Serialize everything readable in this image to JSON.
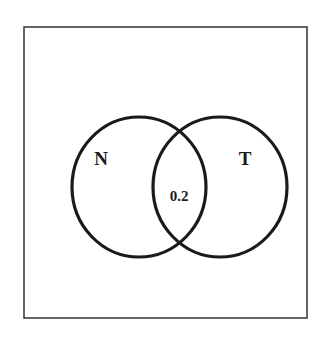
{
  "diagram": {
    "type": "venn",
    "sets": [
      {
        "label": "N"
      },
      {
        "label": "T"
      }
    ],
    "intersection": {
      "value": "0.2"
    },
    "colors": {
      "stroke": "#1a1a1a",
      "frame": "#333333",
      "background": "#ffffff"
    }
  }
}
